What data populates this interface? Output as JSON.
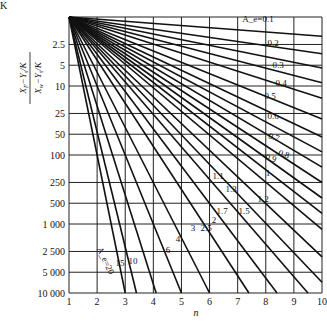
{
  "chart_data": {
    "type": "line",
    "title": "",
    "corner_label": "K",
    "xlabel": "n",
    "ylabel_numerator": "X_F − Y_s/K",
    "ylabel_denominator": "X_w − Y_s/K",
    "x_ticks": [
      1,
      2,
      3,
      4,
      5,
      6,
      7,
      8,
      9,
      10
    ],
    "y_ticks": [
      2.5,
      5,
      10,
      25,
      50,
      100,
      250,
      500,
      1000,
      2500,
      5000,
      10000
    ],
    "y_tick_labels": [
      "2.5",
      "5",
      "10",
      "25",
      "50",
      "100",
      "250",
      "500",
      "1 000",
      "2 500",
      "5 000",
      "10 000"
    ],
    "y_scale": "log",
    "y_inverted": true,
    "xlim": [
      1,
      10
    ],
    "ylim": [
      1,
      10000
    ],
    "grid": true,
    "series": [
      {
        "name": "A_e=0.1",
        "label": "A_e=0.1",
        "x": [
          1,
          10
        ],
        "y": [
          1,
          1.9
        ]
      },
      {
        "name": "0.2",
        "label": "0.2",
        "x": [
          1,
          10
        ],
        "y": [
          1,
          3.4
        ]
      },
      {
        "name": "0.3",
        "label": "0.3",
        "x": [
          1,
          10
        ],
        "y": [
          1,
          5.5
        ]
      },
      {
        "name": "0.4",
        "label": "0.4",
        "x": [
          1,
          10
        ],
        "y": [
          1,
          9
        ]
      },
      {
        "name": "0.5",
        "label": "0.5",
        "x": [
          1,
          10
        ],
        "y": [
          1,
          15
        ]
      },
      {
        "name": "0.6",
        "label": "0.6",
        "x": [
          1,
          10
        ],
        "y": [
          1,
          30
        ]
      },
      {
        "name": "0.7",
        "label": "0.7",
        "x": [
          1,
          10
        ],
        "y": [
          1,
          55
        ]
      },
      {
        "name": "0.8",
        "label": "0.8",
        "x": [
          1,
          10
        ],
        "y": [
          1,
          90
        ]
      },
      {
        "name": "0.9",
        "label": "0.9",
        "x": [
          1,
          10
        ],
        "y": [
          1,
          150
        ]
      },
      {
        "name": "1",
        "label": "1",
        "x": [
          1,
          10
        ],
        "y": [
          1,
          250
        ]
      },
      {
        "name": "1.1",
        "label": "1.1",
        "x": [
          1,
          10
        ],
        "y": [
          1,
          420
        ]
      },
      {
        "name": "1.2",
        "label": "1.2",
        "x": [
          1,
          10
        ],
        "y": [
          1,
          700
        ]
      },
      {
        "name": "1.3",
        "label": "1.3",
        "x": [
          1,
          10
        ],
        "y": [
          1,
          1200
        ]
      },
      {
        "name": "1.5",
        "label": "1.5",
        "x": [
          1,
          10
        ],
        "y": [
          1,
          3000
        ]
      },
      {
        "name": "1.7",
        "label": "1.7",
        "x": [
          1,
          10
        ],
        "y": [
          1,
          7000
        ]
      },
      {
        "name": "2",
        "label": "2",
        "x": [
          1,
          9.5
        ],
        "y": [
          1,
          10000
        ]
      },
      {
        "name": "2.5",
        "label": "2.5",
        "x": [
          1,
          8.4
        ],
        "y": [
          1,
          10000
        ]
      },
      {
        "name": "3",
        "label": "3",
        "x": [
          1,
          7.4
        ],
        "y": [
          1,
          10000
        ]
      },
      {
        "name": "4",
        "label": "4",
        "x": [
          1,
          6.0
        ],
        "y": [
          1,
          10000
        ]
      },
      {
        "name": "6",
        "label": "6",
        "x": [
          1,
          5.0
        ],
        "y": [
          1,
          10000
        ]
      },
      {
        "name": "10",
        "label": "10",
        "x": [
          1,
          4.1
        ],
        "y": [
          1,
          10000
        ]
      },
      {
        "name": "15",
        "label": "15",
        "x": [
          1,
          3.4
        ],
        "y": [
          1,
          10000
        ]
      },
      {
        "name": "A_e=20",
        "label": "A_e=20",
        "x": [
          1,
          3.0
        ],
        "y": [
          1,
          10000
        ]
      }
    ]
  },
  "labels": {
    "corner": "K",
    "xlabel": "n"
  }
}
